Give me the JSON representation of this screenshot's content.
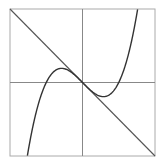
{
  "chart_data": {
    "type": "line",
    "title": "",
    "xlabel": "",
    "ylabel": "",
    "xlim": [
      -2,
      2
    ],
    "ylim": [
      -2,
      2
    ],
    "grid": false,
    "axes_through_origin": true,
    "legend": null,
    "series": [
      {
        "name": "y = x^3 - x",
        "x": [
          -1.52,
          -1.25,
          -1.0,
          -0.75,
          -0.577,
          -0.5,
          -0.25,
          0,
          0.25,
          0.5,
          0.577,
          0.75,
          1.0,
          1.25,
          1.52
        ],
        "values": [
          -2.0,
          -0.7,
          0,
          0.33,
          0.385,
          0.375,
          0.23,
          0,
          -0.23,
          -0.375,
          -0.385,
          -0.33,
          0,
          0.7,
          2.0
        ],
        "color": "#333333"
      },
      {
        "name": "y = -x",
        "x": [
          -2,
          2
        ],
        "values": [
          2,
          -2
        ],
        "color": "#555555"
      }
    ]
  },
  "colors": {
    "frame": "#aaaaaa",
    "axes": "#888888",
    "curve": "#333333",
    "line": "#555555"
  }
}
